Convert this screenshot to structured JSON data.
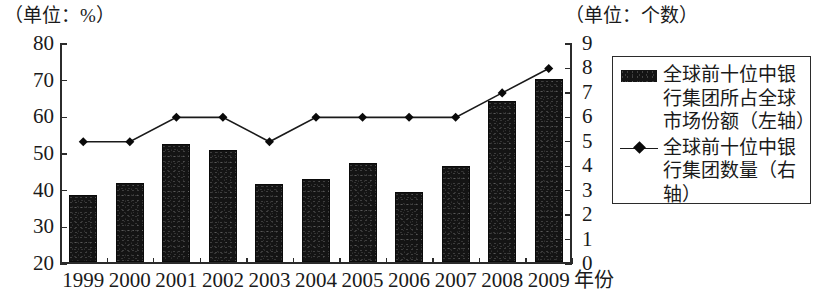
{
  "captions": {
    "left_unit": "（单位：%）",
    "right_unit": "（单位：个数）"
  },
  "axes": {
    "x_title": "年份",
    "left_ticks": [
      "80",
      "70",
      "60",
      "50",
      "40",
      "30",
      "20"
    ],
    "right_ticks": [
      "9",
      "8",
      "7",
      "6",
      "5",
      "4",
      "3",
      "2",
      "1",
      "0"
    ]
  },
  "legend": {
    "items": [
      {
        "marker": "filled-bar-swatch",
        "label": "全球前十位中银\n行集团所占全球\n市场份额（左轴）"
      },
      {
        "marker": "line-diamond-swatch",
        "label": "全球前十位中银\n行集团数量（右\n轴）"
      }
    ]
  },
  "colors": {
    "bar_fill": "#141414",
    "line_stroke": "#1a1a1a",
    "marker_fill": "#0a0a0a",
    "axis": "#2b2b2b",
    "background": "#ffffff"
  },
  "chart_data": {
    "type": "bar",
    "title": "",
    "subtitle": "",
    "xlabel": "年份",
    "ylabel": "（单位：%）",
    "y2label": "（单位：个数）",
    "grid": false,
    "legend_position": "right",
    "categories": [
      "1999",
      "2000",
      "2001",
      "2002",
      "2003",
      "2004",
      "2005",
      "2006",
      "2007",
      "2008",
      "2009"
    ],
    "ylim": [
      20,
      80
    ],
    "y2lim": [
      0,
      9
    ],
    "yticks": [
      20,
      30,
      40,
      50,
      60,
      70,
      80
    ],
    "y2ticks": [
      0,
      1,
      2,
      3,
      4,
      5,
      6,
      7,
      8,
      9
    ],
    "series": [
      {
        "name": "全球前十位中银行集团所占全球市场份额（左轴）",
        "type": "bar",
        "axis": "left",
        "values": [
          38.5,
          41.7,
          52.3,
          50.7,
          41.5,
          42.7,
          47.0,
          39.3,
          46.2,
          64.0,
          70.0
        ]
      },
      {
        "name": "全球前十位中银行集团数量（右轴）",
        "type": "line",
        "axis": "right",
        "marker": "diamond",
        "values": [
          5,
          5,
          6,
          6,
          5,
          6,
          6,
          6,
          6,
          7,
          8
        ]
      }
    ]
  }
}
